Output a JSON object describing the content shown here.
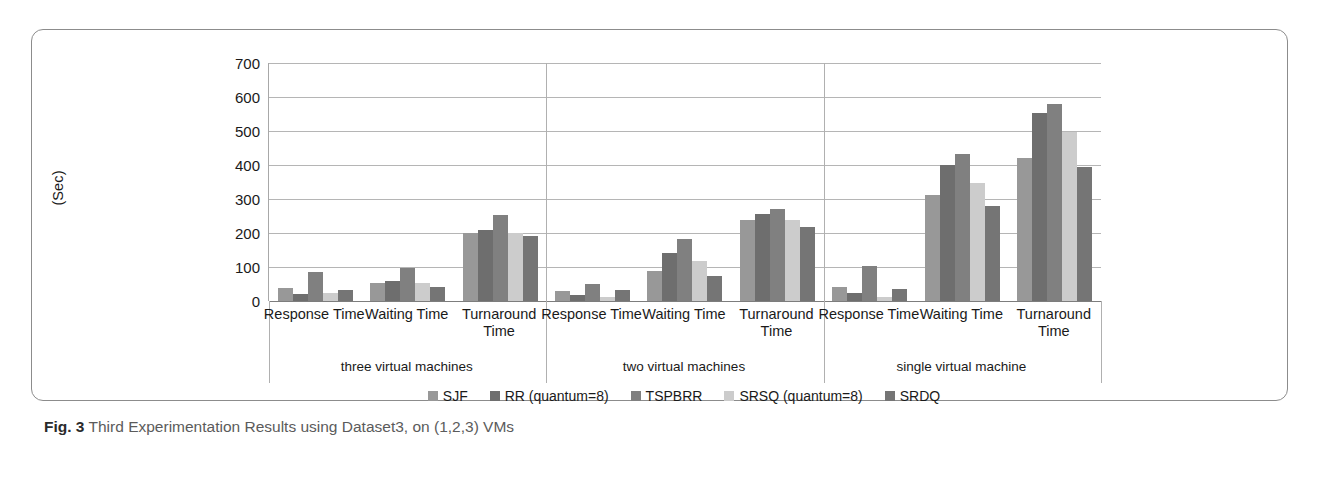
{
  "caption": {
    "label": "Fig. 3",
    "text": "Third Experimentation Results using Dataset3, on (1,2,3) VMs"
  },
  "chart_data": {
    "type": "bar",
    "title": "",
    "xlabel": "",
    "ylabel": "(Sec)",
    "ylim": [
      0,
      700
    ],
    "yticks": [
      700,
      600,
      500,
      400,
      300,
      200,
      100,
      0
    ],
    "grid": true,
    "legend_position": "bottom",
    "groups": [
      "three virtual machines",
      "two virtual machines",
      "single virtual machine"
    ],
    "categories": [
      "Response Time",
      "Waiting Time",
      "Turnaround Time"
    ],
    "series": [
      {
        "name": "SJF",
        "color": "#989898",
        "values": [
          [
            38,
            52,
            199
          ],
          [
            30,
            88,
            238
          ],
          [
            42,
            313,
            420
          ]
        ]
      },
      {
        "name": "RR (quantum=8)",
        "color": "#6e6e6e",
        "values": [
          [
            22,
            60,
            209
          ],
          [
            18,
            140,
            255
          ],
          [
            25,
            400,
            553
          ]
        ]
      },
      {
        "name": "TSPBRR",
        "color": "#808080",
        "values": [
          [
            86,
            96,
            253
          ],
          [
            51,
            182,
            270
          ],
          [
            104,
            432,
            580
          ]
        ]
      },
      {
        "name": "SRSQ (quantum=8)",
        "color": "#cccccc",
        "values": [
          [
            23,
            52,
            199
          ],
          [
            12,
            117,
            239
          ],
          [
            13,
            348,
            497
          ]
        ]
      },
      {
        "name": "SRDQ",
        "color": "#757575",
        "values": [
          [
            33,
            41,
            190
          ],
          [
            32,
            73,
            219
          ],
          [
            36,
            280,
            393
          ]
        ]
      }
    ]
  }
}
